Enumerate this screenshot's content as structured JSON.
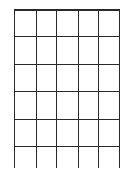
{
  "grid": {
    "columns": 5,
    "rows": 6,
    "line_color": "#2a2a2a",
    "background": "#ffffff",
    "x_lines": [
      14,
      36,
      56,
      78,
      98,
      119
    ],
    "y_lines": [
      9,
      36,
      64,
      91,
      119,
      146
    ],
    "vertical_extent": [
      9,
      168
    ],
    "horizontal_extent": [
      14,
      120
    ]
  }
}
